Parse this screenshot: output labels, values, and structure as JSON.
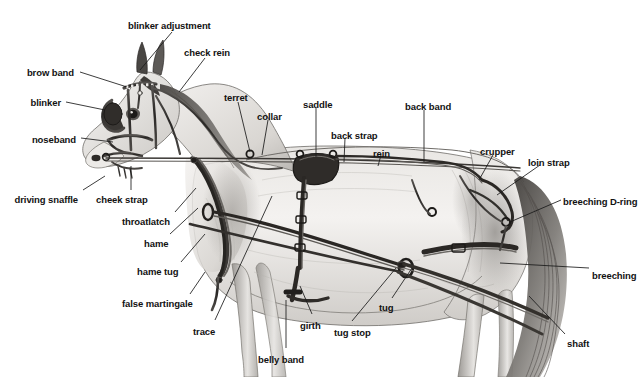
{
  "diagram": {
    "style": "pencil-shaded technical illustration",
    "background_color": "#ffffff",
    "label_color": "#121212",
    "leader_line_color": "#1a1a1a",
    "ink_color": "#2b2b2b",
    "coat_light": "#f2f0ee",
    "coat_mid": "#c9c6c2",
    "coat_dark": "#8d8a86"
  },
  "labels": [
    {
      "id": "blinker-adjustment",
      "text": "blinker adjustment",
      "x": 128,
      "y": 20,
      "align": "left",
      "leader": [
        [
          172,
          32
        ],
        [
          140,
          70
        ]
      ]
    },
    {
      "id": "check-rein",
      "text": "check rein",
      "x": 184,
      "y": 47,
      "align": "left",
      "leader": [
        [
          205,
          58
        ],
        [
          179,
          92
        ]
      ]
    },
    {
      "id": "brow-band",
      "text": "brow band",
      "x": 74,
      "y": 67,
      "align": "right",
      "leader": [
        [
          80,
          72
        ],
        [
          127,
          87
        ]
      ]
    },
    {
      "id": "blinker",
      "text": "blinker",
      "x": 61,
      "y": 97,
      "align": "right",
      "leader": [
        [
          66,
          102
        ],
        [
          105,
          110
        ]
      ]
    },
    {
      "id": "noseband",
      "text": "noseband",
      "x": 76,
      "y": 134,
      "align": "right",
      "leader": [
        [
          81,
          138
        ],
        [
          113,
          142
        ]
      ]
    },
    {
      "id": "driving-snaffle",
      "text": "driving snaffle",
      "x": 78,
      "y": 194,
      "align": "right",
      "leader": [
        [
          83,
          190
        ],
        [
          105,
          176
        ]
      ]
    },
    {
      "id": "cheek-strap",
      "text": "cheek strap",
      "x": 96,
      "y": 194,
      "align": "left",
      "leader": [
        [
          131,
          190
        ],
        [
          131,
          166
        ]
      ]
    },
    {
      "id": "throatlatch",
      "text": "throatlatch",
      "x": 122,
      "y": 216,
      "align": "left",
      "leader": [
        [
          175,
          212
        ],
        [
          196,
          188
        ]
      ]
    },
    {
      "id": "hame",
      "text": "hame",
      "x": 144,
      "y": 238,
      "align": "left",
      "leader": [
        [
          170,
          234
        ],
        [
          198,
          208
        ]
      ]
    },
    {
      "id": "hame-tug",
      "text": "hame tug",
      "x": 137,
      "y": 266,
      "align": "left",
      "leader": [
        [
          181,
          262
        ],
        [
          205,
          234
        ]
      ]
    },
    {
      "id": "false-martingale",
      "text": "false martingale",
      "x": 122,
      "y": 298,
      "align": "left",
      "leader": [
        [
          190,
          294
        ],
        [
          205,
          272
        ]
      ]
    },
    {
      "id": "trace",
      "text": "trace",
      "x": 193,
      "y": 326,
      "align": "left",
      "leader": [
        [
          215,
          320
        ],
        [
          272,
          196
        ]
      ]
    },
    {
      "id": "belly-band",
      "text": "belly band",
      "x": 258,
      "y": 354,
      "align": "left",
      "leader": [
        [
          286,
          348
        ],
        [
          286,
          300
        ]
      ]
    },
    {
      "id": "girth",
      "text": "girth",
      "x": 300,
      "y": 320,
      "align": "left",
      "leader": [
        [
          312,
          314
        ],
        [
          300,
          286
        ]
      ]
    },
    {
      "id": "tug-stop",
      "text": "tug stop",
      "x": 334,
      "y": 327,
      "align": "left",
      "leader": [
        [
          352,
          321
        ],
        [
          396,
          268
        ]
      ]
    },
    {
      "id": "tug",
      "text": "tug",
      "x": 379,
      "y": 302,
      "align": "left",
      "leader": [
        [
          392,
          298
        ],
        [
          412,
          268
        ]
      ]
    },
    {
      "id": "terret",
      "text": "terret",
      "x": 224,
      "y": 92,
      "align": "left",
      "leader": [
        [
          238,
          102
        ],
        [
          250,
          152
        ]
      ]
    },
    {
      "id": "collar",
      "text": "collar",
      "x": 257,
      "y": 111,
      "align": "left",
      "leader": [
        [
          268,
          120
        ],
        [
          262,
          155
        ]
      ]
    },
    {
      "id": "saddle",
      "text": "saddle",
      "x": 303,
      "y": 99,
      "align": "left",
      "leader": [
        [
          316,
          108
        ],
        [
          316,
          157
        ]
      ]
    },
    {
      "id": "back-strap",
      "text": "back strap",
      "x": 331,
      "y": 130,
      "align": "left",
      "leader": [
        [
          345,
          138
        ],
        [
          344,
          162
        ]
      ]
    },
    {
      "id": "rein",
      "text": "rein",
      "x": 373,
      "y": 148,
      "align": "left",
      "leader": [
        [
          381,
          155
        ],
        [
          378,
          166
        ]
      ]
    },
    {
      "id": "back-band",
      "text": "back band",
      "x": 405,
      "y": 101,
      "align": "left",
      "leader": [
        [
          424,
          110
        ],
        [
          424,
          162
        ]
      ]
    },
    {
      "id": "crupper",
      "text": "crupper",
      "x": 480,
      "y": 146,
      "align": "left",
      "leader": [
        [
          493,
          155
        ],
        [
          479,
          180
        ]
      ]
    },
    {
      "id": "loin-strap",
      "text": "loin strap",
      "x": 528,
      "y": 157,
      "align": "left",
      "leader": [
        [
          540,
          165
        ],
        [
          497,
          195
        ]
      ]
    },
    {
      "id": "breeching-d-ring",
      "text": "breeching D-ring",
      "x": 563,
      "y": 196,
      "align": "left",
      "leader": [
        [
          561,
          200
        ],
        [
          510,
          222
        ]
      ]
    },
    {
      "id": "breeching",
      "text": "breeching",
      "x": 592,
      "y": 270,
      "align": "left",
      "leader": [
        [
          589,
          268
        ],
        [
          500,
          263
        ]
      ]
    },
    {
      "id": "shaft",
      "text": "shaft",
      "x": 567,
      "y": 338,
      "align": "left",
      "leader": [
        [
          565,
          334
        ],
        [
          529,
          296
        ]
      ]
    }
  ],
  "chart_data": {
    "type": "diagram",
    "callout_count": 27,
    "callouts": [
      "blinker adjustment",
      "check rein",
      "brow band",
      "blinker",
      "noseband",
      "driving snaffle",
      "cheek strap",
      "throatlatch",
      "hame",
      "hame tug",
      "false martingale",
      "trace",
      "belly band",
      "girth",
      "tug stop",
      "tug",
      "terret",
      "collar",
      "saddle",
      "back strap",
      "rein",
      "back band",
      "crupper",
      "loin strap",
      "breeching D-ring",
      "breeching",
      "shaft"
    ]
  }
}
